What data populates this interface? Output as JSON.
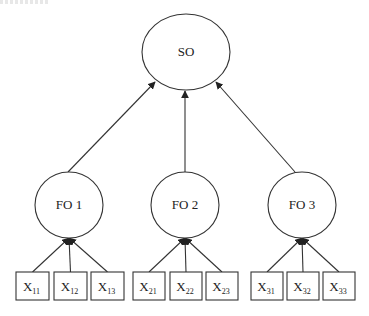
{
  "diagram": {
    "type": "second-order-factor-model",
    "colors": {
      "stroke": "#333333",
      "background": "#ffffff",
      "text": "#222222"
    },
    "second_order": {
      "id": "SO",
      "label": "SO",
      "cx": 186,
      "cy": 52,
      "rx": 44,
      "ry": 38
    },
    "first_order": [
      {
        "id": "FO1",
        "label": "FO 1",
        "cx": 69,
        "cy": 205,
        "rx": 34,
        "ry": 33,
        "edge_to_so": {
          "x1": 68,
          "y1": 172,
          "x2": 155,
          "y2": 82
        },
        "indicators": [
          {
            "base": "X",
            "sub": "11",
            "x": 16,
            "y": 272,
            "w": 33,
            "h": 28
          },
          {
            "base": "X",
            "sub": "12",
            "x": 54,
            "y": 272,
            "w": 33,
            "h": 28
          },
          {
            "base": "X",
            "sub": "13",
            "x": 91,
            "y": 272,
            "w": 33,
            "h": 28
          }
        ]
      },
      {
        "id": "FO2",
        "label": "FO 2",
        "cx": 185,
        "cy": 205,
        "rx": 34,
        "ry": 33,
        "edge_to_so": {
          "x1": 185,
          "y1": 172,
          "x2": 185,
          "y2": 91
        },
        "indicators": [
          {
            "base": "X",
            "sub": "21",
            "x": 133,
            "y": 272,
            "w": 32,
            "h": 28
          },
          {
            "base": "X",
            "sub": "22",
            "x": 170,
            "y": 272,
            "w": 32,
            "h": 28
          },
          {
            "base": "X",
            "sub": "23",
            "x": 206,
            "y": 272,
            "w": 32,
            "h": 28
          }
        ]
      },
      {
        "id": "FO3",
        "label": "FO 3",
        "cx": 302,
        "cy": 205,
        "rx": 34,
        "ry": 33,
        "edge_to_so": {
          "x1": 295,
          "y1": 172,
          "x2": 216,
          "y2": 82
        },
        "indicators": [
          {
            "base": "X",
            "sub": "31",
            "x": 251,
            "y": 272,
            "w": 32,
            "h": 28
          },
          {
            "base": "X",
            "sub": "32",
            "x": 287,
            "y": 272,
            "w": 32,
            "h": 28
          },
          {
            "base": "X",
            "sub": "33",
            "x": 323,
            "y": 272,
            "w": 32,
            "h": 28
          }
        ]
      }
    ]
  }
}
